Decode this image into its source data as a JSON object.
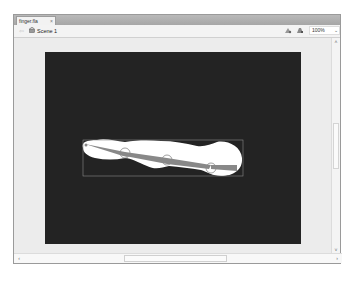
{
  "document": {
    "tab_label": "finger.fla",
    "tab_close": "×"
  },
  "edit_bar": {
    "back_glyph": "⇦",
    "scene_label": "Scene 1",
    "zoom_value": "100%",
    "zoom_arrow": "⌄"
  },
  "scrollbars": {
    "up": "˄",
    "down": "˅",
    "left": "‹",
    "right": "›"
  },
  "stage": {
    "background": "#232323",
    "shape_fill": "#ffffff",
    "bone_color": "#888888",
    "selection_box_color": "#8a8a8a"
  }
}
